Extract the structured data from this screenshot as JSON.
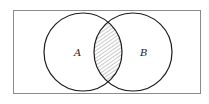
{
  "diagram": {
    "type": "venn",
    "universe_rect": {
      "x": 13.5,
      "y": 10.5,
      "w": 187,
      "h": 83,
      "stroke": "#8a8a8a"
    },
    "sets": [
      {
        "label": "A",
        "cx": 83,
        "cy": 52,
        "r": 39,
        "label_x": 74,
        "label_y": 56
      },
      {
        "label": "B",
        "cx": 133,
        "cy": 52,
        "r": 39,
        "label_x": 140,
        "label_y": 56
      }
    ],
    "shaded_region": "A ∩ B",
    "hatch_color": "#777777",
    "stroke_color": "#1a1a1a"
  }
}
